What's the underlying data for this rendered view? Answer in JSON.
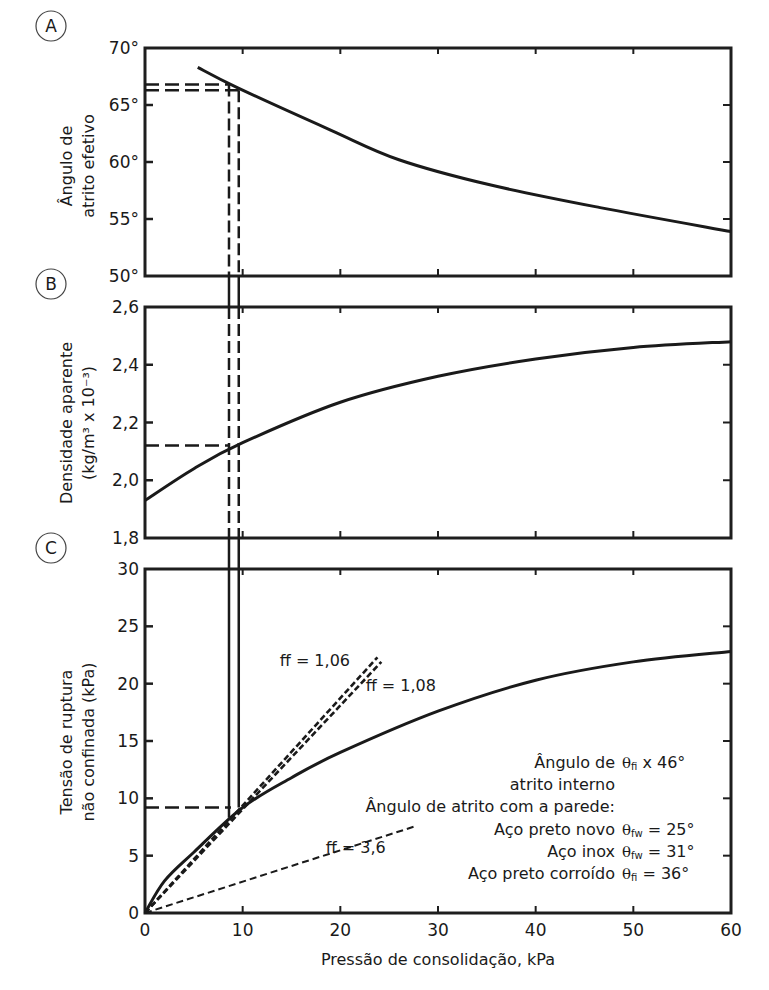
{
  "figure": {
    "x_axis_label": "Pressão de consolidação, kPa",
    "x_ticks": [
      "0",
      "10",
      "20",
      "30",
      "40",
      "50",
      "60"
    ]
  },
  "chart_data": [
    {
      "type": "line",
      "panel_label": "A",
      "title": "",
      "xlabel": "Pressão de consolidação, kPa",
      "ylabel": "Ângulo de atrito efetivo",
      "ylabel_lines": [
        "Ângulo de",
        "atrito efetivo"
      ],
      "xlim": [
        0,
        60
      ],
      "ylim": [
        50,
        70
      ],
      "y_ticks": [
        "50°",
        "55°",
        "60°",
        "65°",
        "70°"
      ],
      "y_tick_values": [
        50,
        55,
        60,
        65,
        70
      ],
      "grid": false,
      "series": [
        {
          "name": "Ângulo de atrito efetivo",
          "style": "solid",
          "x": [
            5.4,
            9.5,
            19,
            26,
            35.3,
            46.6,
            60
          ],
          "y": [
            68.3,
            66.5,
            62.8,
            60.2,
            58.0,
            56.0,
            53.9
          ]
        }
      ],
      "guides": [
        {
          "type": "horizontal-dashed",
          "y": 66.8,
          "x_to": 8.5
        },
        {
          "type": "horizontal-dashed",
          "y": 66.3,
          "x_to": 9.6
        }
      ]
    },
    {
      "type": "line",
      "panel_label": "B",
      "title": "",
      "xlabel": "Pressão de consolidação, kPa",
      "ylabel": "Densidade aparente (kg/m³ x 10⁻³)",
      "ylabel_lines": [
        "Densidade aparente",
        "(kg/m³ x 10⁻³)"
      ],
      "xlim": [
        0,
        60
      ],
      "ylim": [
        1.8,
        2.6
      ],
      "y_ticks": [
        "1,8",
        "2,0",
        "2,2",
        "2,4",
        "2,6"
      ],
      "y_tick_values": [
        1.8,
        2.0,
        2.2,
        2.4,
        2.6
      ],
      "grid": false,
      "series": [
        {
          "name": "Densidade aparente",
          "style": "solid",
          "x": [
            0,
            5,
            10,
            20,
            30,
            40,
            50,
            60
          ],
          "y": [
            1.93,
            2.04,
            2.13,
            2.27,
            2.36,
            2.42,
            2.46,
            2.48
          ]
        }
      ],
      "guides": [
        {
          "type": "horizontal-dashed",
          "y": 2.12,
          "x_to": 8.6
        }
      ]
    },
    {
      "type": "line",
      "panel_label": "C",
      "title": "",
      "xlabel": "Pressão de consolidação, kPa",
      "ylabel": "Tensão de ruptura não confinada (kPa)",
      "ylabel_lines": [
        "Tensão de ruptura",
        "não confinada (kPa)"
      ],
      "xlim": [
        0,
        60
      ],
      "ylim": [
        0,
        30
      ],
      "x_ticks": [
        "0",
        "10",
        "20",
        "30",
        "40",
        "50",
        "60"
      ],
      "x_tick_values": [
        0,
        10,
        20,
        30,
        40,
        50,
        60
      ],
      "y_ticks": [
        "0",
        "5",
        "10",
        "15",
        "20",
        "25",
        "30"
      ],
      "y_tick_values": [
        0,
        5,
        10,
        15,
        20,
        25,
        30
      ],
      "grid": false,
      "series": [
        {
          "name": "Tensão de ruptura",
          "style": "solid",
          "x": [
            0,
            2,
            5,
            10,
            15,
            20,
            30,
            40,
            50,
            60
          ],
          "y": [
            0,
            2.8,
            5.3,
            9.2,
            11.8,
            14.0,
            17.6,
            20.3,
            21.9,
            22.8
          ]
        },
        {
          "name": "ff = 1,06",
          "style": "dashed",
          "x": [
            0,
            23.8
          ],
          "y": [
            0,
            22.3
          ]
        },
        {
          "name": "ff = 1,08",
          "style": "dashed",
          "x": [
            0,
            24.2
          ],
          "y": [
            0,
            21.9
          ]
        },
        {
          "name": "ff = 3,6",
          "style": "dashed-thin",
          "x": [
            0,
            27.8
          ],
          "y": [
            0,
            7.6
          ]
        }
      ],
      "guides": [
        {
          "type": "horizontal-dashed",
          "y": 9.2,
          "x_to": 8.8
        },
        {
          "type": "vertical-solid",
          "x": 8.6,
          "from_panel": "A",
          "to_y": 8.3
        },
        {
          "type": "vertical-solid",
          "x": 9.6,
          "from_panel": "A",
          "to_y": 9.2
        }
      ],
      "annotations": [
        {
          "text": "ff = 1,06",
          "x": 13.8,
          "y": 21.5
        },
        {
          "text": "ff = 1,08",
          "x": 22.6,
          "y": 19.4
        },
        {
          "text": "ff = 3,6",
          "x": 18.5,
          "y": 5.2
        }
      ],
      "legend": {
        "position": "lower-right",
        "rows": [
          {
            "label": "Ângulo de",
            "value": "θfi x 46°",
            "symbol": "θ",
            "sub": "fi",
            "rest": " x 46°"
          },
          {
            "label": "atrito interno",
            "value": ""
          },
          {
            "label": "Ângulo de atrito com a parede:",
            "value": ""
          },
          {
            "label": "Aço preto novo",
            "value": "θfw = 25°",
            "symbol": "θ",
            "sub": "fw",
            "rest": " = 25°"
          },
          {
            "label": "Aço inox",
            "value": "θfw = 31°",
            "symbol": "θ",
            "sub": "fw",
            "rest": " = 31°"
          },
          {
            "label": "Aço preto corroído",
            "value": "θfi = 36°",
            "symbol": "θ",
            "sub": "fi",
            "rest": " = 36°"
          }
        ]
      }
    }
  ]
}
